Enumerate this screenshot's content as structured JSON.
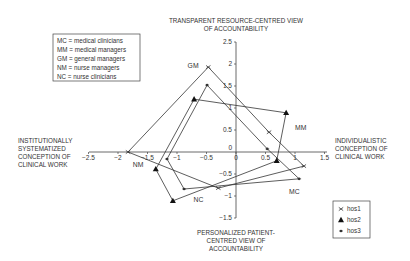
{
  "chart_data": {
    "type": "scatter",
    "subtype": "polygon-map",
    "axis_titles": {
      "top": [
        "TRANSPARENT RESOURCE-CENTRED VIEW",
        "OF ACCOUNTABILITY"
      ],
      "bottom": [
        "PERSONALIZED PATIENT-",
        "CENTRED VIEW OF",
        "ACCOUNTABILITY"
      ],
      "left": [
        "INSTITUTIONALLY",
        "SYSTEMATIZED",
        "CONCEPTION OF",
        "CLINICAL WORK"
      ],
      "right": [
        "INDIVIDUALISTIC",
        "CONCEPTION OF",
        "CLINICAL WORK"
      ]
    },
    "xlim": [
      -2.5,
      1.5
    ],
    "ylim": [
      -1.5,
      2.5
    ],
    "x_ticks": [
      {
        "value": -2.5,
        "label": "−2.5"
      },
      {
        "value": -2,
        "label": "−2"
      },
      {
        "value": -1.5,
        "label": "−1.5"
      },
      {
        "value": -1,
        "label": "−1"
      },
      {
        "value": -0.5,
        "label": "−0.5"
      },
      {
        "value": 0,
        "label": "0"
      },
      {
        "value": 0.5,
        "label": "0.5"
      },
      {
        "value": 1,
        "label": "1"
      },
      {
        "value": 1.5,
        "label": "1.5"
      }
    ],
    "y_ticks": [
      {
        "value": 2.5,
        "label": "2.5"
      },
      {
        "value": 2,
        "label": "2"
      },
      {
        "value": 1.5,
        "label": "1.5"
      },
      {
        "value": 1,
        "label": "1"
      },
      {
        "value": 0.5,
        "label": "0.5"
      },
      {
        "value": -0.5,
        "label": "−0.5"
      },
      {
        "value": -1,
        "label": "−1"
      },
      {
        "value": -1.5,
        "label": "−1.5"
      }
    ],
    "grid": false,
    "groups": [
      "GM",
      "MM",
      "MC",
      "NC",
      "NM"
    ],
    "series": [
      {
        "name": "hos1",
        "marker": "x",
        "points": [
          {
            "group": "GM",
            "x": -0.47,
            "y": 1.93
          },
          {
            "group": "MM",
            "x": 0.56,
            "y": 0.45
          },
          {
            "group": "MC",
            "x": 1.15,
            "y": -0.32
          },
          {
            "group": "NC",
            "x": -0.3,
            "y": -0.82
          },
          {
            "group": "NM",
            "x": -1.83,
            "y": 0.0
          }
        ]
      },
      {
        "name": "hos2",
        "marker": "triangle",
        "points": [
          {
            "group": "GM",
            "x": -0.71,
            "y": 1.2
          },
          {
            "group": "MM",
            "x": 0.85,
            "y": 0.89
          },
          {
            "group": "MC",
            "x": 0.69,
            "y": -0.2
          },
          {
            "group": "NC",
            "x": -1.07,
            "y": -1.11
          },
          {
            "group": "NM",
            "x": -1.36,
            "y": -0.39
          }
        ]
      },
      {
        "name": "hos3",
        "marker": "asterisk",
        "points": [
          {
            "group": "GM",
            "x": -0.49,
            "y": 1.52
          },
          {
            "group": "MM",
            "x": 0.53,
            "y": 0.07
          },
          {
            "group": "MC",
            "x": 1.07,
            "y": -0.61
          },
          {
            "group": "NC",
            "x": -0.88,
            "y": -0.84
          },
          {
            "group": "NM",
            "x": -1.17,
            "y": -0.16
          }
        ]
      }
    ],
    "point_labels": [
      {
        "text": "GM",
        "x": -0.82,
        "y": 1.92
      },
      {
        "text": "MM",
        "x": 1.0,
        "y": 0.5
      },
      {
        "text": "MC",
        "x": 0.9,
        "y": -0.95
      },
      {
        "text": "NC",
        "x": -0.72,
        "y": -1.13
      },
      {
        "text": "NM",
        "x": -1.75,
        "y": -0.35
      }
    ],
    "abbreviation_legend": [
      "MC = medical clinicians",
      "MM = medical managers",
      "GM = general managers",
      "NM = nurse managers",
      "NC = nurse clinicians"
    ],
    "series_legend": [
      "hos1",
      "hos2",
      "hos3"
    ],
    "legend_position": "bottom-right"
  }
}
